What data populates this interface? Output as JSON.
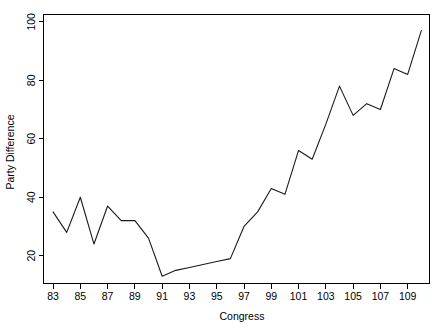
{
  "chart_data": {
    "type": "line",
    "title": "",
    "xlabel": "Congress",
    "ylabel": "Party Difference",
    "xlim": [
      82.3,
      110.6
    ],
    "ylim": [
      10.5,
      102.5
    ],
    "xticks": [
      83,
      85,
      87,
      89,
      91,
      93,
      95,
      97,
      99,
      101,
      103,
      105,
      107,
      109
    ],
    "xtick_labels": [
      "83",
      "85",
      "87",
      "89",
      "91",
      "93",
      "95",
      "97",
      "99",
      "101",
      "103",
      "105",
      "107",
      "109"
    ],
    "yticks": [
      20,
      40,
      60,
      80,
      100
    ],
    "ytick_labels": [
      "20",
      "40",
      "60",
      "80",
      "100"
    ],
    "grid": false,
    "legend": false,
    "x": [
      83,
      84,
      85,
      86,
      87,
      88,
      89,
      90,
      91,
      92,
      93,
      94,
      95,
      96,
      97,
      98,
      99,
      100,
      101,
      102,
      103,
      104,
      105,
      106,
      107,
      108,
      109,
      110
    ],
    "values": [
      35,
      27,
      40,
      24,
      37,
      33,
      33,
      26,
      13,
      15,
      16,
      17,
      18,
      19,
      30,
      26,
      43,
      41,
      56,
      53,
      65,
      61,
      72,
      78,
      68,
      73,
      71,
      84
    ],
    "series": [
      {
        "name": "Party Difference",
        "color": "#1a1a1a",
        "points": [
          {
            "congress": 83,
            "value": 35
          },
          {
            "congress": 84,
            "value": 28
          },
          {
            "congress": 85,
            "value": 40
          },
          {
            "congress": 86,
            "value": 24
          },
          {
            "congress": 87,
            "value": 37
          },
          {
            "congress": 88,
            "value": 32
          },
          {
            "congress": 89,
            "value": 32
          },
          {
            "congress": 90,
            "value": 26
          },
          {
            "congress": 91,
            "value": 13
          },
          {
            "congress": 92,
            "value": 15
          },
          {
            "congress": 93,
            "value": 16
          },
          {
            "congress": 94,
            "value": 17
          },
          {
            "congress": 95,
            "value": 18
          },
          {
            "congress": 96,
            "value": 19
          },
          {
            "congress": 97,
            "value": 30
          },
          {
            "congress": 98,
            "value": 35
          },
          {
            "congress": 99,
            "value": 43
          },
          {
            "congress": 100,
            "value": 41
          },
          {
            "congress": 101,
            "value": 56
          },
          {
            "congress": 102,
            "value": 53
          },
          {
            "congress": 103,
            "value": 65
          },
          {
            "congress": 104,
            "value": 78
          },
          {
            "congress": 105,
            "value": 68
          },
          {
            "congress": 106,
            "value": 72
          },
          {
            "congress": 107,
            "value": 70
          },
          {
            "congress": 108,
            "value": 84
          },
          {
            "congress": 109,
            "value": 82
          },
          {
            "congress": 110,
            "value": 97
          }
        ]
      }
    ]
  }
}
